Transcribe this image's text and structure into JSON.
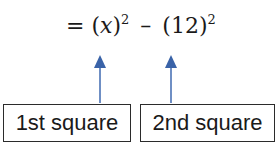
{
  "equation": {
    "equals": "=",
    "term1_open": "(",
    "term1_var": "x",
    "term1_close": ")",
    "term1_exp": "2",
    "minus": "–",
    "term2_open": "(",
    "term2_value": "12",
    "term2_close": ")",
    "term2_exp": "2"
  },
  "labels": {
    "first": "1st square",
    "second": "2nd square"
  },
  "colors": {
    "arrow": "#3a63a8",
    "text": "#1a1a1a"
  }
}
